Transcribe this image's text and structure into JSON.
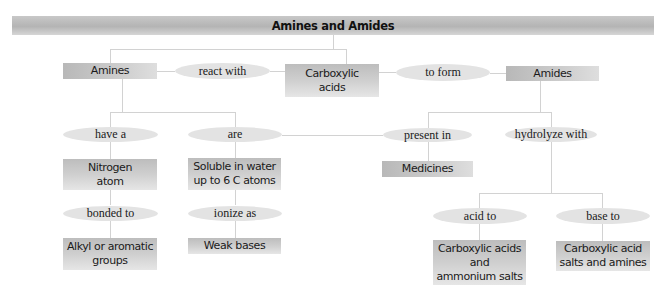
{
  "title": "Amines and Amides",
  "nodes": {
    "amines": "Amines",
    "react_with": "react with",
    "carboxylic_acids": "Carboxylic acids",
    "to_form": "to form",
    "amides": "Amides",
    "have_a": "have a",
    "are": "are",
    "present_in": "present in",
    "hydrolyze_with": "hydrolyze with",
    "nitrogen_atom": "Nitrogen atom",
    "soluble": "Soluble in water up to 6 C atoms",
    "medicines": "Medicines",
    "bonded_to": "bonded to",
    "ionize_as": "ionize as",
    "acid_to": "acid to",
    "base_to": "base to",
    "alkyl_groups": "Alkyl or aromatic groups",
    "weak_bases": "Weak bases",
    "acid_products": "Carboxylic acids and ammonium salts",
    "base_products": "Carboxylic acid salts and amines"
  },
  "node_lines": {
    "carboxylic_acids": [
      "Carboxylic",
      "acids"
    ],
    "nitrogen_atom": [
      "Nitrogen",
      "atom"
    ],
    "soluble": [
      "Soluble in water",
      "up to 6 C atoms"
    ],
    "alkyl_groups": [
      "Alkyl or aromatic",
      "groups"
    ],
    "acid_products": [
      "Carboxylic acids",
      "and",
      "ammonium salts"
    ],
    "base_products": [
      "Carboxylic acid",
      "salts and amines"
    ]
  },
  "colors": {
    "box_fill": "#c8c8c8",
    "oval_fill": "#e3e3e3",
    "connector": "#d2d2d2",
    "text": "#1a1a1a"
  }
}
